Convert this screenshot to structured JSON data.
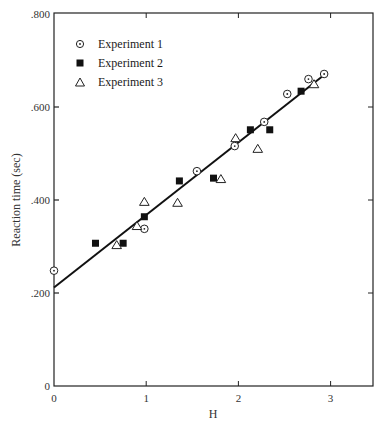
{
  "chart_data": {
    "type": "scatter",
    "title": "",
    "xlabel": "H",
    "ylabel": "Reaction time (sec)",
    "xlim": [
      0,
      3.45
    ],
    "ylim": [
      0,
      0.8
    ],
    "x_ticks": [
      "0",
      "1",
      "2",
      "3"
    ],
    "y_ticks": [
      "0",
      ".200",
      ".400",
      ".600",
      ".800"
    ],
    "grid": false,
    "legend_position": "upper-left",
    "series": [
      {
        "name": "Experiment 1",
        "marker": "circle-dot",
        "points": [
          [
            0.0,
            0.248
          ],
          [
            0.98,
            0.338
          ],
          [
            1.55,
            0.462
          ],
          [
            1.96,
            0.516
          ],
          [
            2.28,
            0.568
          ],
          [
            2.53,
            0.628
          ],
          [
            2.76,
            0.66
          ],
          [
            2.93,
            0.671
          ]
        ]
      },
      {
        "name": "Experiment 2",
        "marker": "filled-square",
        "points": [
          [
            0.45,
            0.307
          ],
          [
            0.75,
            0.307
          ],
          [
            0.98,
            0.364
          ],
          [
            1.36,
            0.441
          ],
          [
            1.73,
            0.447
          ],
          [
            2.13,
            0.551
          ],
          [
            2.34,
            0.551
          ],
          [
            2.68,
            0.634
          ]
        ]
      },
      {
        "name": "Experiment 3",
        "marker": "open-triangle",
        "points": [
          [
            0.68,
            0.303
          ],
          [
            0.9,
            0.344
          ],
          [
            0.98,
            0.396
          ],
          [
            1.34,
            0.394
          ],
          [
            1.81,
            0.445
          ],
          [
            1.97,
            0.533
          ],
          [
            2.21,
            0.51
          ],
          [
            2.82,
            0.649
          ]
        ]
      }
    ],
    "fit_line": {
      "type": "linear",
      "from": [
        0.0,
        0.212
      ],
      "to": [
        2.95,
        0.672
      ]
    }
  },
  "legend": {
    "items": [
      {
        "label": "Experiment 1"
      },
      {
        "label": "Experiment 2"
      },
      {
        "label": "Experiment 3"
      }
    ]
  },
  "axes": {
    "x_label": "H",
    "y_label": "Reaction time (sec)"
  }
}
